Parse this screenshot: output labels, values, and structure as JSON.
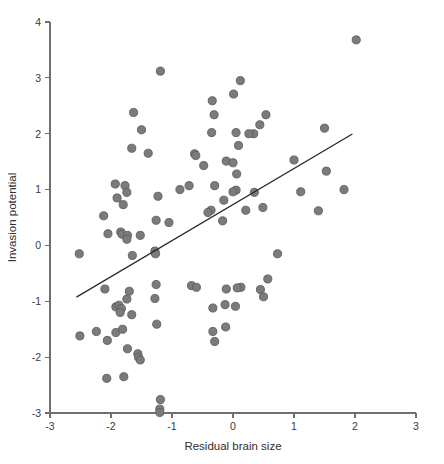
{
  "chart_data": {
    "type": "scatter",
    "title": "",
    "xlabel": "Residual brain size",
    "ylabel": "Invasion potential",
    "xlim": [
      -3,
      3
    ],
    "ylim": [
      -3,
      4
    ],
    "xticks": [
      -3,
      -2,
      -1,
      0,
      1,
      2,
      3
    ],
    "xtick_labels": [
      "-3",
      "-2",
      "-1",
      "0",
      "1",
      "2",
      "3"
    ],
    "yticks": [
      -3,
      -2,
      -1,
      0,
      1,
      2,
      3,
      4
    ],
    "ytick_labels": [
      "-3",
      "-2",
      "-1",
      "0",
      "1",
      "2",
      "3",
      "4"
    ],
    "grid": false,
    "legend": null,
    "marker": {
      "shape": "circle",
      "size_px": 7.3,
      "fill": "#7b7b7b",
      "edge": "#5e5e5e"
    },
    "trend_line": {
      "type": "linear-fit",
      "color": "#2b2b2b",
      "x_start": -2.56,
      "y_start": -0.92,
      "x_end": 1.95,
      "y_end": 1.99,
      "slope": 0.646,
      "intercept": 0.734
    },
    "points": [
      [
        2.02,
        3.68
      ],
      [
        -1.19,
        3.12
      ],
      [
        0.12,
        2.95
      ],
      [
        0.01,
        2.71
      ],
      [
        -0.34,
        2.59
      ],
      [
        -1.63,
        2.38
      ],
      [
        0.54,
        2.34
      ],
      [
        -0.31,
        2.34
      ],
      [
        1.5,
        2.1
      ],
      [
        -1.5,
        2.07
      ],
      [
        0.44,
        2.16
      ],
      [
        0.05,
        2.02
      ],
      [
        -0.35,
        2.02
      ],
      [
        0.34,
        2.0
      ],
      [
        0.26,
        2.0
      ],
      [
        0.09,
        1.79
      ],
      [
        -1.66,
        1.74
      ],
      [
        -1.39,
        1.65
      ],
      [
        -0.63,
        1.64
      ],
      [
        -0.61,
        1.61
      ],
      [
        1.0,
        1.53
      ],
      [
        -0.11,
        1.51
      ],
      [
        0.0,
        1.48
      ],
      [
        -0.48,
        1.43
      ],
      [
        1.53,
        1.33
      ],
      [
        0.06,
        1.28
      ],
      [
        -0.72,
        1.07
      ],
      [
        -0.3,
        1.07
      ],
      [
        -1.93,
        1.1
      ],
      [
        -1.77,
        1.07
      ],
      [
        -1.74,
        0.95
      ],
      [
        -0.87,
        1.0
      ],
      [
        1.82,
        1.0
      ],
      [
        1.11,
        0.96
      ],
      [
        0.35,
        0.95
      ],
      [
        0.05,
        0.99
      ],
      [
        0.0,
        0.96
      ],
      [
        -1.9,
        0.85
      ],
      [
        -1.8,
        0.73
      ],
      [
        -1.23,
        0.88
      ],
      [
        -0.15,
        0.81
      ],
      [
        0.49,
        0.68
      ],
      [
        0.21,
        0.63
      ],
      [
        1.4,
        0.62
      ],
      [
        -0.36,
        0.63
      ],
      [
        -0.41,
        0.59
      ],
      [
        -2.12,
        0.53
      ],
      [
        -1.26,
        0.45
      ],
      [
        -1.05,
        0.41
      ],
      [
        -0.17,
        0.44
      ],
      [
        -2.05,
        0.21
      ],
      [
        -1.84,
        0.24
      ],
      [
        -1.82,
        0.2
      ],
      [
        -1.73,
        0.18
      ],
      [
        -1.52,
        0.18
      ],
      [
        -1.74,
        0.11
      ],
      [
        -2.52,
        -0.15
      ],
      [
        -1.65,
        -0.18
      ],
      [
        -1.28,
        -0.1
      ],
      [
        -1.27,
        -0.15
      ],
      [
        0.73,
        -0.15
      ],
      [
        0.57,
        -0.6
      ],
      [
        -1.26,
        -0.7
      ],
      [
        -0.68,
        -0.72
      ],
      [
        -0.6,
        -0.75
      ],
      [
        -2.1,
        -0.78
      ],
      [
        -0.11,
        -0.78
      ],
      [
        0.13,
        -0.75
      ],
      [
        0.07,
        -0.76
      ],
      [
        0.45,
        -0.79
      ],
      [
        -1.7,
        -0.82
      ],
      [
        -1.28,
        -0.95
      ],
      [
        -1.74,
        -0.96
      ],
      [
        0.5,
        -0.92
      ],
      [
        -1.92,
        -1.1
      ],
      [
        -1.87,
        -1.07
      ],
      [
        -1.83,
        -1.13
      ],
      [
        -1.85,
        -1.2
      ],
      [
        -0.33,
        -1.12
      ],
      [
        -0.13,
        -1.06
      ],
      [
        0.04,
        -1.09
      ],
      [
        -1.66,
        -1.24
      ],
      [
        -1.25,
        -1.41
      ],
      [
        -0.33,
        -1.54
      ],
      [
        -0.12,
        -1.46
      ],
      [
        -0.3,
        -1.72
      ],
      [
        -2.51,
        -1.62
      ],
      [
        -2.24,
        -1.54
      ],
      [
        -1.92,
        -1.56
      ],
      [
        -1.81,
        -1.5
      ],
      [
        -2.06,
        -1.7
      ],
      [
        -1.73,
        -1.85
      ],
      [
        -1.56,
        -1.94
      ],
      [
        -1.55,
        -2.0
      ],
      [
        -1.52,
        -2.05
      ],
      [
        -2.07,
        -2.38
      ],
      [
        -1.79,
        -2.35
      ],
      [
        -1.19,
        -2.76
      ],
      [
        -1.2,
        -2.93
      ],
      [
        -1.2,
        -2.99
      ]
    ]
  },
  "axes": {
    "x_title": "Residual brain size",
    "y_title": "Invasion potential"
  }
}
